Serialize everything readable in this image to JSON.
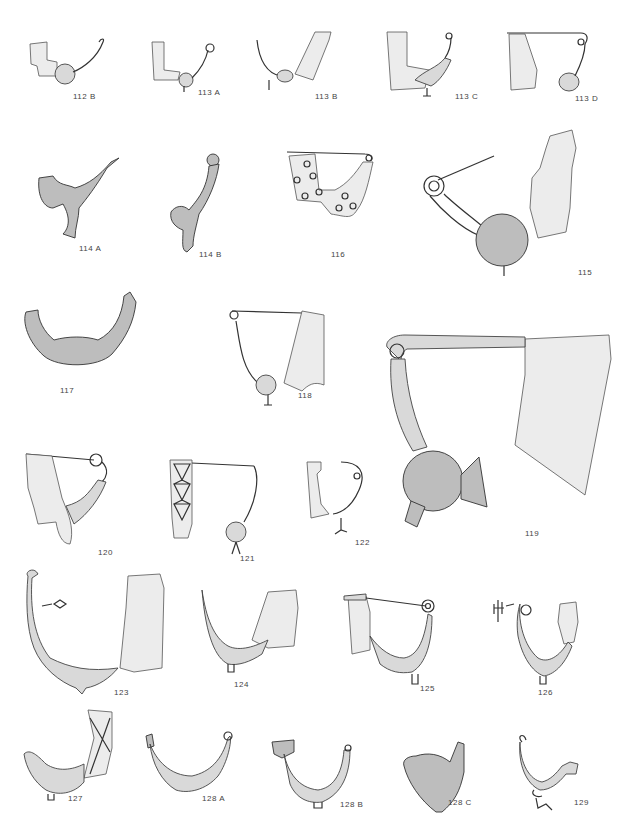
{
  "plate": {
    "figures": [
      {
        "id": "112B",
        "label": "112 B"
      },
      {
        "id": "113A",
        "label": "113 A"
      },
      {
        "id": "113B",
        "label": "113 B"
      },
      {
        "id": "113C",
        "label": "113 C"
      },
      {
        "id": "113D",
        "label": "113 D"
      },
      {
        "id": "114A",
        "label": "114 A"
      },
      {
        "id": "114B",
        "label": "114 B"
      },
      {
        "id": "116",
        "label": "116"
      },
      {
        "id": "115",
        "label": "115"
      },
      {
        "id": "117",
        "label": "117"
      },
      {
        "id": "118",
        "label": "118"
      },
      {
        "id": "119",
        "label": "119"
      },
      {
        "id": "120",
        "label": "120"
      },
      {
        "id": "121",
        "label": "121"
      },
      {
        "id": "122",
        "label": "122"
      },
      {
        "id": "123",
        "label": "123"
      },
      {
        "id": "124",
        "label": "124"
      },
      {
        "id": "125",
        "label": "125"
      },
      {
        "id": "126",
        "label": "126"
      },
      {
        "id": "127",
        "label": "127"
      },
      {
        "id": "128A",
        "label": "128 A"
      },
      {
        "id": "128B",
        "label": "128 B"
      },
      {
        "id": "128C",
        "label": "128 C"
      },
      {
        "id": "129",
        "label": "129"
      }
    ]
  }
}
